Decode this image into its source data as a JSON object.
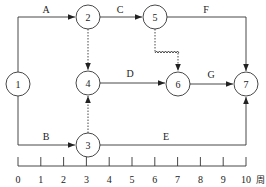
{
  "diagram": {
    "type": "time-scaled network (double-code) diagram",
    "nodes": [
      {
        "id": "1",
        "label": "1",
        "x": 18,
        "y": 84
      },
      {
        "id": "2",
        "label": "2",
        "x": 88,
        "y": 17
      },
      {
        "id": "3",
        "label": "3",
        "x": 88,
        "y": 145
      },
      {
        "id": "4",
        "label": "4",
        "x": 88,
        "y": 83
      },
      {
        "id": "5",
        "label": "5",
        "x": 155,
        "y": 17
      },
      {
        "id": "6",
        "label": "6",
        "x": 178,
        "y": 84
      },
      {
        "id": "7",
        "label": "7",
        "x": 246,
        "y": 84
      }
    ],
    "activities": [
      {
        "label": "A",
        "from": "1",
        "to": "2",
        "type": "real"
      },
      {
        "label": "B",
        "from": "1",
        "to": "3",
        "type": "real"
      },
      {
        "label": "C",
        "from": "2",
        "to": "5",
        "type": "real"
      },
      {
        "label": "D",
        "from": "4",
        "to": "6",
        "type": "real"
      },
      {
        "label": "E",
        "from": "3",
        "to": "7",
        "type": "real"
      },
      {
        "label": "F",
        "from": "5",
        "to": "7",
        "type": "real"
      },
      {
        "label": "G",
        "from": "6",
        "to": "7",
        "type": "real"
      },
      {
        "label": "",
        "from": "2",
        "to": "4",
        "type": "dummy"
      },
      {
        "label": "",
        "from": "3",
        "to": "4",
        "type": "dummy"
      },
      {
        "label": "",
        "from": "5",
        "to": "6",
        "type": "dummy-with-free-float"
      }
    ],
    "timeline": {
      "ticks": [
        "0",
        "1",
        "2",
        "3",
        "4",
        "5",
        "6",
        "7",
        "8",
        "9",
        "10"
      ],
      "unit": "周"
    }
  }
}
